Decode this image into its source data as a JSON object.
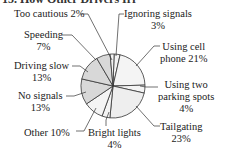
{
  "title": "15.   How Other Drivers Irr",
  "chart_data": {
    "type": "pie",
    "slices": [
      {
        "label": "Ignoring signals",
        "value": 3,
        "fill": "#f4f4f4"
      },
      {
        "label": "Using cell phone",
        "value": 21,
        "fill": "#f4f4f4"
      },
      {
        "label": "Using two parking spots",
        "value": 4,
        "fill": "#f4f4f4"
      },
      {
        "label": "Tailgating",
        "value": 23,
        "fill": "#eeeeee"
      },
      {
        "label": "Bright lights",
        "value": 4,
        "fill": "#f4f4f4"
      },
      {
        "label": "Other",
        "value": 10,
        "fill": "#f4f4f4"
      },
      {
        "label": "No signals",
        "value": 13,
        "fill": "#d8d8d8"
      },
      {
        "label": "Driving slow",
        "value": 13,
        "fill": "#d8d8d8"
      },
      {
        "label": "Speeding",
        "value": 7,
        "fill": "#d8d8d8"
      },
      {
        "label": "Too cautious",
        "value": 2,
        "fill": "#f4f4f4"
      }
    ],
    "unit": "%"
  },
  "labels": {
    "too_cautious": "Too cautious 2%",
    "ignoring_1": "Ignoring signals",
    "ignoring_2": "3%",
    "speeding_1": "Speeding",
    "speeding_2": "7%",
    "driving_slow_1": "Driving slow",
    "driving_slow_2": "13%",
    "no_signals_1": "No signals",
    "no_signals_2": "13%",
    "other": "Other 10%",
    "bright_1": "Bright lights",
    "bright_2": "4%",
    "cell_1": "Using cell",
    "cell_2": "phone 21%",
    "parking_1": "Using two",
    "parking_2": "parking spots",
    "parking_3": "4%",
    "tailgating_1": "Tailgating",
    "tailgating_2": "23%"
  }
}
